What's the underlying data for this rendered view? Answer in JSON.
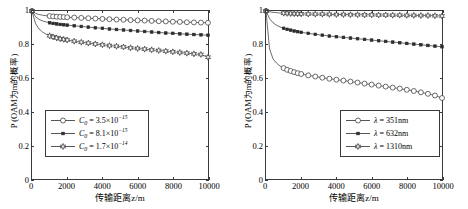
{
  "figure": {
    "panels": [
      {
        "id": "left",
        "xlabel": "传输距离z/m",
        "ylabel": "P (OAM为m的概率)",
        "yticks": [
          "0",
          "0.2",
          "0.4",
          "0.6",
          "0.8",
          "1"
        ],
        "xticks": [
          "0",
          "2000",
          "4000",
          "6000",
          "8000",
          "10000"
        ],
        "legend": [
          {
            "label_prefix": "C",
            "label_sub": "0",
            "label_eq": " = 3.5×10",
            "label_exp": "−15",
            "marker": "circle"
          },
          {
            "label_prefix": "C",
            "label_sub": "0",
            "label_eq": " = 8.1×10",
            "label_exp": "−15",
            "marker": "square"
          },
          {
            "label_prefix": "C",
            "label_sub": "0",
            "label_eq": " = 1.7×10",
            "label_exp": "−14",
            "marker": "star"
          }
        ]
      },
      {
        "id": "right",
        "xlabel": "传输距离z/m",
        "ylabel": "P (OAM为m的概率)",
        "yticks": [
          "0",
          "0.2",
          "0.4",
          "0.6",
          "0.8",
          "1"
        ],
        "xticks": [
          "0",
          "2000",
          "4000",
          "6000",
          "8000",
          "10000"
        ],
        "legend": [
          {
            "label_prefix": "λ",
            "label_sub": "",
            "label_eq": " = 351nm",
            "label_exp": "",
            "marker": "circle"
          },
          {
            "label_prefix": "λ",
            "label_sub": "",
            "label_eq": " = 632nm",
            "label_exp": "",
            "marker": "square"
          },
          {
            "label_prefix": "λ",
            "label_sub": "",
            "label_eq": " = 1310nm",
            "label_exp": "",
            "marker": "star"
          }
        ]
      }
    ]
  },
  "chart_data": [
    {
      "type": "line",
      "title": "",
      "xlabel": "传输距离z/m",
      "ylabel": "P (OAM为m的概率)",
      "xlim": [
        0,
        10000
      ],
      "ylim": [
        0,
        1
      ],
      "xticks": [
        0,
        2000,
        4000,
        6000,
        8000,
        10000
      ],
      "yticks": [
        0,
        0.2,
        0.4,
        0.6,
        0.8,
        1
      ],
      "grid": false,
      "legend_position": "lower-left",
      "x": [
        0,
        200,
        400,
        600,
        800,
        1000,
        1200,
        1400,
        1600,
        1800,
        2000,
        2400,
        2800,
        3200,
        3600,
        4000,
        4400,
        4800,
        5200,
        5600,
        6000,
        6400,
        6800,
        7200,
        7600,
        8000,
        8400,
        8800,
        9200,
        9600,
        10000
      ],
      "series": [
        {
          "name": "C0 = 3.5e-15",
          "marker": "circle",
          "values": [
            1.0,
            0.986,
            0.979,
            0.975,
            0.972,
            0.97,
            0.968,
            0.966,
            0.965,
            0.964,
            0.963,
            0.961,
            0.959,
            0.957,
            0.955,
            0.953,
            0.951,
            0.949,
            0.948,
            0.946,
            0.944,
            0.943,
            0.941,
            0.939,
            0.938,
            0.936,
            0.935,
            0.933,
            0.932,
            0.931,
            0.93
          ]
        },
        {
          "name": "C0 = 8.1e-15",
          "marker": "square",
          "values": [
            1.0,
            0.966,
            0.95,
            0.941,
            0.935,
            0.93,
            0.926,
            0.923,
            0.92,
            0.918,
            0.916,
            0.912,
            0.908,
            0.904,
            0.9,
            0.897,
            0.893,
            0.89,
            0.887,
            0.884,
            0.881,
            0.878,
            0.875,
            0.872,
            0.869,
            0.867,
            0.864,
            0.862,
            0.86,
            0.858,
            0.856
          ]
        },
        {
          "name": "C0 = 1.7e-14",
          "marker": "star",
          "values": [
            1.0,
            0.925,
            0.893,
            0.875,
            0.862,
            0.853,
            0.846,
            0.84,
            0.835,
            0.831,
            0.827,
            0.82,
            0.814,
            0.809,
            0.804,
            0.799,
            0.794,
            0.79,
            0.786,
            0.781,
            0.777,
            0.773,
            0.769,
            0.765,
            0.761,
            0.757,
            0.753,
            0.749,
            0.745,
            0.741,
            0.725
          ]
        }
      ]
    },
    {
      "type": "line",
      "title": "",
      "xlabel": "传输距离z/m",
      "ylabel": "P (OAM为m的概率)",
      "xlim": [
        0,
        10000
      ],
      "ylim": [
        0,
        1
      ],
      "xticks": [
        0,
        2000,
        4000,
        6000,
        8000,
        10000
      ],
      "yticks": [
        0,
        0.2,
        0.4,
        0.6,
        0.8,
        1
      ],
      "grid": false,
      "legend_position": "lower-right",
      "x": [
        0,
        200,
        400,
        600,
        800,
        1000,
        1200,
        1400,
        1600,
        1800,
        2000,
        2400,
        2800,
        3200,
        3600,
        4000,
        4400,
        4800,
        5200,
        5600,
        6000,
        6400,
        6800,
        7200,
        7600,
        8000,
        8400,
        8800,
        9200,
        9600,
        10000
      ],
      "series": [
        {
          "name": "lambda = 351nm",
          "marker": "circle",
          "values": [
            1.0,
            0.775,
            0.715,
            0.69,
            0.672,
            0.66,
            0.65,
            0.643,
            0.636,
            0.63,
            0.625,
            0.617,
            0.61,
            0.603,
            0.597,
            0.591,
            0.586,
            0.58,
            0.574,
            0.568,
            0.562,
            0.556,
            0.55,
            0.544,
            0.538,
            0.531,
            0.524,
            0.516,
            0.507,
            0.497,
            0.482
          ]
        },
        {
          "name": "lambda = 632nm",
          "marker": "square",
          "values": [
            1.0,
            0.955,
            0.93,
            0.915,
            0.905,
            0.897,
            0.891,
            0.886,
            0.881,
            0.877,
            0.873,
            0.867,
            0.861,
            0.856,
            0.851,
            0.847,
            0.843,
            0.839,
            0.835,
            0.831,
            0.827,
            0.823,
            0.819,
            0.815,
            0.811,
            0.807,
            0.803,
            0.799,
            0.795,
            0.791,
            0.787
          ]
        },
        {
          "name": "lambda = 1310nm",
          "marker": "star",
          "values": [
            1.0,
            0.995,
            0.992,
            0.99,
            0.988,
            0.987,
            0.986,
            0.985,
            0.984,
            0.984,
            0.983,
            0.982,
            0.981,
            0.981,
            0.98,
            0.979,
            0.979,
            0.978,
            0.978,
            0.977,
            0.977,
            0.976,
            0.976,
            0.975,
            0.975,
            0.974,
            0.974,
            0.973,
            0.973,
            0.972,
            0.97
          ]
        }
      ]
    }
  ]
}
